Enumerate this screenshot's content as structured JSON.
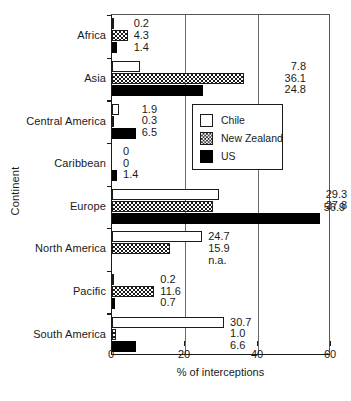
{
  "chart_data": {
    "type": "bar",
    "orientation": "horizontal",
    "title": "",
    "xlabel": "% of interceptions",
    "ylabel": "Continent",
    "xlim": [
      0,
      60
    ],
    "xticks": [
      0,
      20,
      40,
      60
    ],
    "xtick_labels": [
      "0",
      "20",
      "40",
      "60"
    ],
    "grid": "vertical gridlines at 20 and 40",
    "legend_position": "inner, upper-middle-right",
    "categories": [
      "Africa",
      "Asia",
      "Central America",
      "Caribbean",
      "Europe",
      "North America",
      "Pacific",
      "South America"
    ],
    "series": [
      {
        "name": "Chile",
        "fill": "white",
        "values": [
          0.2,
          7.8,
          1.9,
          0,
          29.3,
          24.7,
          0.2,
          30.7
        ],
        "labels": [
          "0.2",
          "7.8",
          "1.9",
          "0",
          "29.3",
          "24.7",
          "0.2",
          "30.7"
        ]
      },
      {
        "name": "New Zealand",
        "fill": "checkerboard",
        "values": [
          4.3,
          36.1,
          0.3,
          0,
          27.8,
          15.9,
          11.6,
          1.0
        ],
        "labels": [
          "4.3",
          "36.1",
          "0.3",
          "0",
          "27.8",
          "15.9",
          "11.6",
          "1.0"
        ]
      },
      {
        "name": "US",
        "fill": "black",
        "values": [
          1.4,
          24.8,
          6.5,
          1.4,
          56.9,
          null,
          0.7,
          6.6
        ],
        "labels": [
          "1.4",
          "24.8",
          "6.5",
          "1.4",
          "56.9",
          "n.a.",
          "0.7",
          "6.6"
        ]
      }
    ],
    "value_label_groups": [
      {
        "category": "Africa",
        "labels": [
          "0.2",
          "4.3",
          "1.4"
        ],
        "align": "left"
      },
      {
        "category": "Asia",
        "labels": [
          "7.8",
          "36.1",
          "24.8"
        ],
        "align": "right"
      },
      {
        "category": "Central America",
        "labels": [
          "1.9",
          "0.3",
          "6.5"
        ],
        "align": "left"
      },
      {
        "category": "Caribbean",
        "labels": [
          "0",
          "0",
          "1.4"
        ],
        "align": "left"
      },
      {
        "category": "Europe",
        "labels": [
          "29.3",
          "27.8",
          ""
        ],
        "align": "left"
      },
      {
        "category": "North America",
        "labels": [
          "24.7",
          "15.9",
          "n.a."
        ],
        "align": "left"
      },
      {
        "category": "Pacific",
        "labels": [
          "0.2",
          "11.6",
          "0.7"
        ],
        "align": "left"
      },
      {
        "category": "South America",
        "labels": [
          "30.7",
          "1.0",
          "6.6"
        ],
        "align": "left"
      }
    ],
    "standalone_labels": [
      {
        "text": "56.9",
        "series": "US",
        "category": "Europe"
      }
    ]
  },
  "legend": {
    "items": [
      {
        "label": "Chile",
        "swatch": "white-square-icon"
      },
      {
        "label": "New Zealand",
        "swatch": "checkered-square-icon"
      },
      {
        "label": "US",
        "swatch": "black-square-icon"
      }
    ]
  },
  "axes": {
    "x_title": "% of interceptions",
    "y_title": "Continent",
    "x_ticks": [
      "0",
      "20",
      "40",
      "60"
    ]
  }
}
